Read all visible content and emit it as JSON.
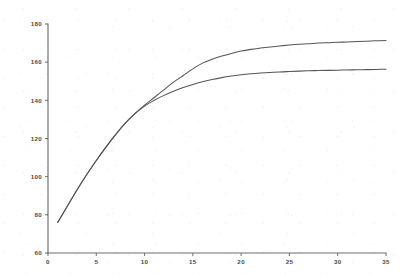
{
  "chart_data": {
    "type": "line",
    "title": "",
    "subtitle": "",
    "xlabel": "",
    "ylabel": "",
    "xlim": [
      0,
      35
    ],
    "ylim": [
      60,
      180
    ],
    "grid": false,
    "legend": "none",
    "xticks": [
      "0",
      "5",
      "10",
      "15",
      "20",
      "25",
      "30",
      "35"
    ],
    "xtick_values": [
      0,
      5,
      10,
      15,
      20,
      25,
      30,
      35
    ],
    "yticks": [
      "60",
      "80",
      "100",
      "120",
      "140",
      "160",
      "180"
    ],
    "ytick_values": [
      60,
      80,
      100,
      120,
      140,
      160,
      180
    ],
    "series": [
      {
        "name": "upper-curve",
        "color": "#555555",
        "x": [
          1,
          2,
          3,
          4,
          5,
          6,
          7,
          8,
          9,
          10,
          11,
          12,
          13,
          14,
          15,
          16,
          17,
          18,
          19,
          20,
          21,
          22,
          23,
          24,
          25,
          26,
          27,
          28,
          29,
          30,
          31,
          32,
          33,
          34,
          35
        ],
        "values": [
          76,
          84.5,
          93,
          101,
          108.5,
          115.5,
          122,
          128,
          133,
          137.5,
          141.5,
          145.5,
          149.5,
          153,
          156.5,
          159.5,
          161.5,
          163.2,
          164.6,
          165.8,
          166.7,
          167.4,
          168,
          168.5,
          169,
          169.4,
          169.7,
          170,
          170.2,
          170.4,
          170.6,
          170.8,
          171,
          171.2,
          171.3
        ]
      },
      {
        "name": "lower-curve",
        "color": "#555555",
        "x": [
          1,
          2,
          3,
          4,
          5,
          6,
          7,
          8,
          9,
          10,
          11,
          12,
          13,
          14,
          15,
          16,
          17,
          18,
          19,
          20,
          21,
          22,
          23,
          24,
          25,
          26,
          27,
          28,
          29,
          30,
          31,
          32,
          33,
          34,
          35
        ],
        "values": [
          76,
          84.5,
          93,
          101,
          108.5,
          115.5,
          122,
          128,
          133,
          137,
          140,
          142.6,
          144.8,
          146.7,
          148.3,
          149.7,
          150.9,
          151.9,
          152.7,
          153.4,
          153.9,
          154.3,
          154.6,
          154.9,
          155.1,
          155.3,
          155.5,
          155.6,
          155.7,
          155.8,
          155.9,
          156,
          156.1,
          156.2,
          156.3
        ]
      }
    ],
    "annotations": []
  },
  "axes": {
    "y_axis_name": "y-axis",
    "x_axis_name": "x-axis"
  }
}
